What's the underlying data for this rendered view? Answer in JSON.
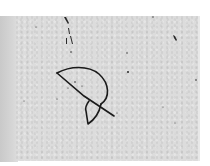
{
  "image": {
    "description": "Scanned grey paper with a hand-drawn semicircle glyph crossed by a diagonal stroke",
    "colors": {
      "paper": "#dcdcdc",
      "ink": "#1a1a1a",
      "margin": "#ffffff"
    }
  }
}
